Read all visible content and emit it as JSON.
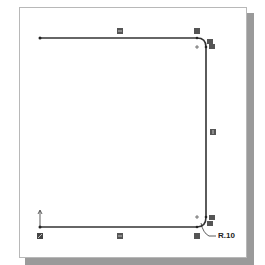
{
  "sketch": {
    "dimension_label": "R.10",
    "relations": {
      "top_line": "horizontal",
      "bottom_line": "horizontal",
      "right_line": "vertical",
      "top_arc": "tangent",
      "bottom_arc": "tangent",
      "origin": "fixed"
    }
  },
  "colors": {
    "line": "#333333",
    "relation_icon": "#555555",
    "paper_shadow": "#9a9a9a"
  }
}
